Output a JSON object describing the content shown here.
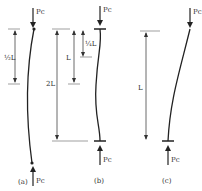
{
  "diagram": {
    "colors": {
      "line": "#222222",
      "dim": "#555555",
      "background": "#ffffff"
    },
    "panels": [
      {
        "id": "a",
        "caption": "(a)",
        "load_top": "Pc",
        "load_bottom": "Pc",
        "dimension_1": "½L",
        "dimension_2": "2L",
        "support": "pinned-pinned"
      },
      {
        "id": "b",
        "caption": "(b)",
        "load_top": "Pc",
        "load_bottom": "Pc",
        "dimension_1": "¼L",
        "dimension_2": "L",
        "support": "fixed-fixed"
      },
      {
        "id": "c",
        "caption": "(c)",
        "load_top": "Pc",
        "load_bottom": "Pc",
        "dimension_1": "L",
        "support": "fixed-free"
      }
    ]
  }
}
